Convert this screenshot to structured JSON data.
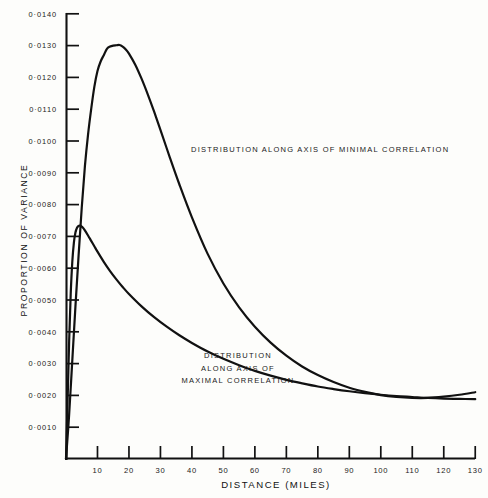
{
  "figure": {
    "background_color": "#fdfdfb",
    "ink_color": "#111111"
  },
  "chart_data": {
    "type": "line",
    "title": "",
    "xlabel": "DISTANCE (MILES)",
    "ylabel": "PROPORTION OF VARIANCE",
    "xlim": [
      0,
      130
    ],
    "ylim": [
      0,
      0.014
    ],
    "grid": false,
    "legend_position": "inline-annotations",
    "x_ticks": [
      0,
      10,
      20,
      30,
      40,
      50,
      60,
      70,
      80,
      90,
      100,
      110,
      120,
      130
    ],
    "x_tick_labels": [
      "",
      "10",
      "20",
      "30",
      "40",
      "50",
      "60",
      "70",
      "80",
      "90",
      "100",
      "110",
      "120",
      "130"
    ],
    "y_ticks": [
      0.001,
      0.002,
      0.003,
      0.004,
      0.005,
      0.006,
      0.007,
      0.008,
      0.009,
      0.01,
      0.011,
      0.012,
      0.013,
      0.014
    ],
    "y_tick_labels": [
      "0·0010",
      "0·0020",
      "0·0030",
      "0·0040",
      "0·0050",
      "0·0060",
      "0·0070",
      "0·0080",
      "0·0090",
      "0·0100",
      "0·0110",
      "0·0120",
      "0·0130",
      "0·0140"
    ],
    "series": [
      {
        "name": "Distribution along axis of minimal correlation",
        "peak_x": 17,
        "peak_y": 0.013,
        "x": [
          0,
          1,
          2,
          3,
          4,
          5,
          6,
          7,
          8,
          9,
          10,
          11,
          12,
          13,
          14,
          15,
          16,
          17,
          18,
          19,
          20,
          22,
          24,
          26,
          28,
          30,
          33,
          36,
          40,
          45,
          50,
          55,
          60,
          65,
          70,
          75,
          80,
          85,
          90,
          95,
          100,
          105,
          110,
          115,
          120,
          125,
          130
        ],
        "values": [
          0.0,
          0.0014,
          0.0031,
          0.0048,
          0.0064,
          0.0079,
          0.0092,
          0.0102,
          0.011,
          0.0117,
          0.0122,
          0.0125,
          0.0127,
          0.0129,
          0.01297,
          0.013,
          0.01301,
          0.01302,
          0.01297,
          0.01288,
          0.01275,
          0.0124,
          0.01196,
          0.01146,
          0.01092,
          0.01035,
          0.00948,
          0.00864,
          0.0076,
          0.00645,
          0.00552,
          0.00477,
          0.00416,
          0.00366,
          0.00325,
          0.00291,
          0.00264,
          0.00242,
          0.00224,
          0.00211,
          0.00201,
          0.00195,
          0.00192,
          0.00192,
          0.00196,
          0.00202,
          0.0021
        ]
      },
      {
        "name": "Distribution along axis of maximal correlation",
        "peak_x": 4.5,
        "peak_y": 0.0073,
        "x": [
          0,
          0.5,
          1,
          1.5,
          2,
          2.5,
          3,
          3.5,
          4,
          4.5,
          5,
          5.5,
          6,
          7,
          8,
          9,
          10,
          12,
          14,
          16,
          18,
          20,
          24,
          28,
          32,
          36,
          40,
          45,
          50,
          55,
          60,
          65,
          70,
          75,
          80,
          85,
          90,
          95,
          100,
          105,
          110,
          115,
          120,
          125,
          130
        ],
        "values": [
          0.0,
          0.0018,
          0.0037,
          0.0052,
          0.0062,
          0.0068,
          0.00712,
          0.00727,
          0.00733,
          0.00734,
          0.00731,
          0.00726,
          0.00719,
          0.00703,
          0.00686,
          0.00669,
          0.00652,
          0.0062,
          0.00591,
          0.00565,
          0.00541,
          0.00519,
          0.0048,
          0.00446,
          0.00416,
          0.00389,
          0.00365,
          0.00338,
          0.00315,
          0.00295,
          0.00277,
          0.00262,
          0.00249,
          0.00238,
          0.00228,
          0.0022,
          0.00213,
          0.00207,
          0.00202,
          0.00198,
          0.00195,
          0.00192,
          0.0019,
          0.00189,
          0.00188
        ]
      }
    ],
    "annotations": [
      {
        "id": "annotation-minimal",
        "lines": [
          "DISTRIBUTION ALONG AXIS OF MINIMAL CORRELATION"
        ],
        "x": 191,
        "y": 152,
        "align": "start"
      },
      {
        "id": "annotation-maximal",
        "lines": [
          "DISTRIBUTION",
          "ALONG AXIS OF",
          "MAXIMAL CORRELATION"
        ],
        "x": 238,
        "y": 358,
        "align": "middle"
      }
    ]
  },
  "geometry": {
    "origin_x": 66,
    "origin_y": 459,
    "axis_top_y": 14,
    "x_px_per_unit": 3.148,
    "y_px_per_unit": 31800
  }
}
